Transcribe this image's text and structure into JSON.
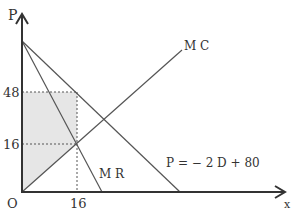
{
  "diagram": {
    "type": "monopoly price/quantity diagram",
    "axes": {
      "y_label": "P",
      "x_label": "x",
      "origin_label": "O"
    },
    "ticks": {
      "y": [
        "48",
        "16"
      ],
      "x": [
        "16"
      ]
    },
    "curves": {
      "mc": "M C",
      "mr": "M R",
      "demand": "P = − 2 D + 80"
    },
    "shaded_region": "area between price 48, MC and y-axis up to quantity 16",
    "colors": {
      "line": "#555555",
      "axis": "#333333",
      "shade": "#e6e6e6",
      "guide": "#555555"
    }
  }
}
